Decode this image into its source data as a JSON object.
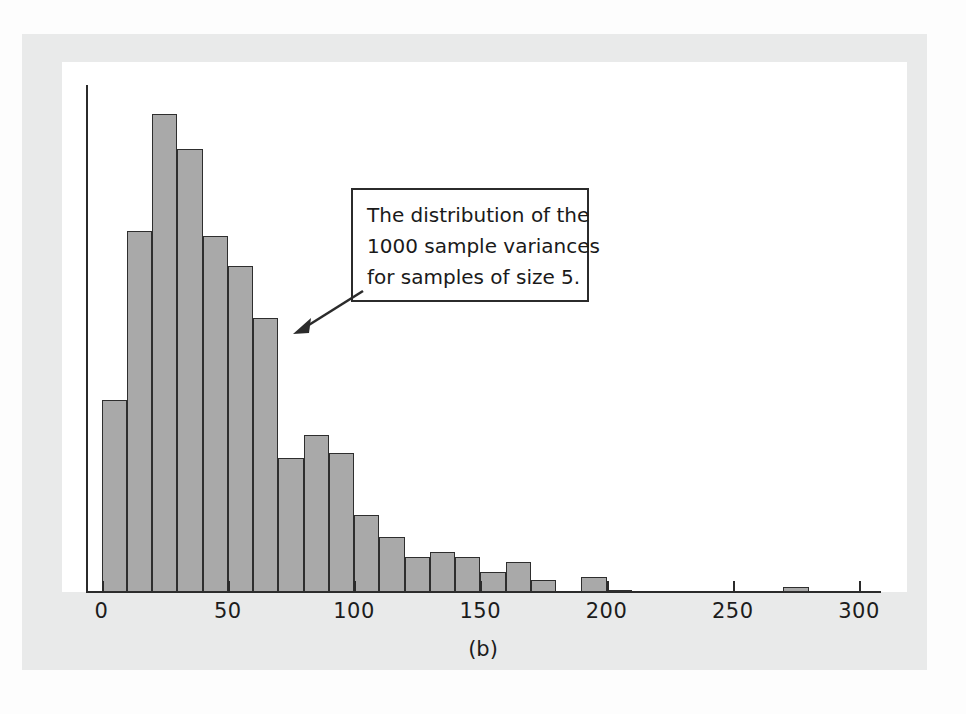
{
  "figure": {
    "caption": "(b)",
    "bar_fill_color": "#a9a9a9",
    "bar_edge_color": "#2e2e2e",
    "axis_color": "#2b2b2b",
    "page_background_color": "#e9eaea",
    "plot_background_color": "#ffffff"
  },
  "callout": {
    "line1": "The distribution of the",
    "line2": "1000 sample variances",
    "line3": "for samples of size 5.",
    "arrow": "arrow-pointing-down-left-to-histogram"
  },
  "chart_data": {
    "type": "bar",
    "title": "",
    "subtitle": "",
    "xlabel": "",
    "ylabel": "",
    "xlim": [
      0,
      305
    ],
    "ylim": [
      0,
      205
    ],
    "grid": false,
    "legend": null,
    "bin_width": 10,
    "bin_starts": [
      0,
      10,
      20,
      30,
      40,
      50,
      60,
      70,
      80,
      90,
      100,
      110,
      120,
      130,
      140,
      150,
      160,
      170,
      190,
      200,
      270
    ],
    "values": [
      77,
      145,
      192,
      178,
      143,
      131,
      110,
      54,
      63,
      56,
      31,
      22,
      14,
      16,
      14,
      8,
      12,
      5,
      6,
      1,
      2
    ],
    "tick_values": [
      0,
      50,
      100,
      150,
      200,
      250,
      300
    ],
    "tick_labels": [
      "0",
      "50",
      "100",
      "150",
      "200",
      "250",
      "300"
    ]
  }
}
